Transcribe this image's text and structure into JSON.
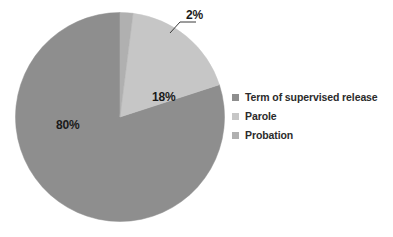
{
  "chart_data": {
    "type": "pie",
    "title": "",
    "subtitle": "",
    "xlabel": "",
    "ylabel": "",
    "grid": false,
    "legend_position": "right",
    "categories": [
      "Term of supervised release",
      "Parole",
      "Probation"
    ],
    "values": [
      80,
      18,
      2
    ],
    "value_labels": [
      "80%",
      "18%",
      "2%"
    ],
    "slice_colors": [
      "#8e8e8e",
      "#c6c6c6",
      "#b0b0b0"
    ],
    "background_color": "#ffffff",
    "label_color": "#1a1a1a",
    "start_angle_deg": 0,
    "direction": "clockwise",
    "slices": [
      {
        "name": "Probation",
        "value": 2,
        "label": "2%",
        "color": "#b0b0b0",
        "label_placement": "outside",
        "leader_line": true
      },
      {
        "name": "Parole",
        "value": 18,
        "label": "18%",
        "color": "#c6c6c6",
        "label_placement": "inside",
        "leader_line": false
      },
      {
        "name": "Term of supervised release",
        "value": 80,
        "label": "80%",
        "color": "#8e8e8e",
        "label_placement": "inside",
        "leader_line": false
      }
    ]
  },
  "legend": {
    "items": [
      {
        "label": "Term of supervised release",
        "color": "#8e8e8e"
      },
      {
        "label": "Parole",
        "color": "#c6c6c6"
      },
      {
        "label": "Probation",
        "color": "#b0b0b0"
      }
    ]
  },
  "labels": {
    "major": "80%",
    "middle": "18%",
    "minor": "2%"
  }
}
